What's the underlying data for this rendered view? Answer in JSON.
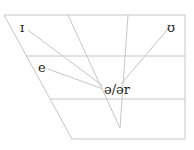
{
  "diagram": {
    "title": "",
    "type": "vowel-chart",
    "labels": {
      "high_front": "ɪ",
      "high_back": "ʊ",
      "mid_front": "e",
      "target": "ə/ər"
    },
    "colors": {
      "lines": "#c8c8c8",
      "text": "#222222"
    }
  }
}
